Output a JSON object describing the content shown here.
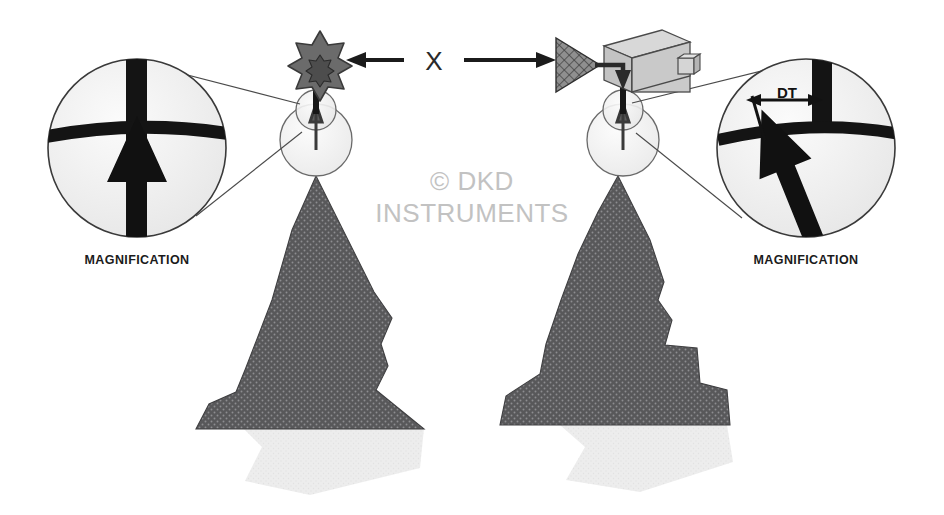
{
  "figure": {
    "background_color": "#ffffff",
    "watermark": {
      "line1": "© DKD",
      "line2": "INSTRUMENTS",
      "color": "#c2c2c2"
    },
    "center_label": {
      "text": "X",
      "color": "#2a2a2a",
      "description": "center annotation between the two left/right pointing arrows"
    }
  },
  "left_panel": {
    "name": "aligned-case",
    "magnification_label": "MAGNIFICATION",
    "instrument": {
      "type": "star-burst-emitter",
      "points": 8,
      "fill": "#6b6b6b",
      "stroke": "#3a3a3a"
    },
    "pointer_arrow": {
      "direction": "left",
      "color": "#1b1b1b"
    },
    "reticle": {
      "vertical_line": true,
      "horizontal_line": true,
      "arrow_offset": "none",
      "arrow_direction": "up",
      "arrow_color": "#121212",
      "crosshair_color": "#141414",
      "lens_fill": "#f2f2f2"
    },
    "mountain": {
      "fill": "#58585a",
      "shadow_fill": "#ebebeb",
      "profile": "smooth-peak"
    }
  },
  "right_panel": {
    "name": "offset-case",
    "magnification_label": "MAGNIFICATION",
    "instrument": {
      "type": "camera-box",
      "box_fill": "#c9c9c9",
      "box_top_fill": "#d8d8d8",
      "box_side_fill": "#b0b0b0",
      "stroke": "#4a4a4a",
      "hatched_triangle_fill": "#8a8a8a"
    },
    "pointer_arrow": {
      "direction": "right",
      "color": "#1b1b1b"
    },
    "reticle": {
      "vertical_line": true,
      "horizontal_line": true,
      "arrow_offset": "tilted-left",
      "arrow_direction": "up-right",
      "arrow_color": "#121212",
      "crosshair_color": "#141414",
      "lens_fill": "#f2f2f2",
      "measurement": {
        "label": "DT",
        "type": "double-headed-dimension-arrow",
        "color": "#121212"
      }
    },
    "mountain": {
      "fill": "#58585a",
      "shadow_fill": "#ebebeb",
      "profile": "stepped-peak"
    }
  },
  "colors": {
    "ink": "#1b1b1b",
    "mountain": "#58585a",
    "mountain_dots": "#8d8d90",
    "shadow": "#ebebeb",
    "lens_glass": "#f2f2f2",
    "lens_stroke": "#4a4a4a",
    "watermark": "#c2c2c2",
    "metal": "#c9c9c9"
  }
}
